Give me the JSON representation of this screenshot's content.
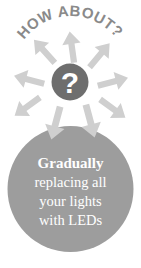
{
  "poster": {
    "heading_arc": "HOW ABOUT?",
    "center_icon": "question-mark-icon",
    "center_glyph": "?",
    "message_lines": [
      {
        "text": "Gradually",
        "emphasis": "bold"
      },
      {
        "text": "replacing all",
        "emphasis": "normal"
      },
      {
        "text": "your lights",
        "emphasis": "normal"
      },
      {
        "text": "with LEDs",
        "emphasis": "normal"
      }
    ],
    "arrows": {
      "count": 8,
      "description": "radiating-arrows",
      "directions": [
        "up-left",
        "up",
        "up-right",
        "left",
        "right",
        "down-left",
        "down",
        "down-right"
      ]
    },
    "colors": {
      "background": "#ffffff",
      "heading_text": "#8a8a8a",
      "arrow": "#cfcfcf",
      "center_circle": "#6e6e6e",
      "center_glyph": "#ffffff",
      "main_circle": "#9d9d9d",
      "body_text": "#ffffff"
    }
  }
}
